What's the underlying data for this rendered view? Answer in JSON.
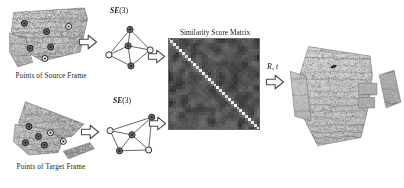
{
  "figure": {
    "type": "pipeline-diagram",
    "background": "#ffffff",
    "ink": "#1a1a1a"
  },
  "rows": {
    "source": {
      "caption": "Points of Source Frame",
      "graph_label_prefix": "SE",
      "graph_label_suffix": "(3)",
      "arrow1_name": "arrow-source-to-graph",
      "arrow2_name": "arrow-source-graph-to-matrix"
    },
    "target": {
      "caption": "Points of Target Frame",
      "graph_label_prefix": "SE",
      "graph_label_suffix": "(3)",
      "arrow1_name": "arrow-target-to-graph",
      "arrow2_name": "arrow-target-graph-to-matrix"
    }
  },
  "matrix": {
    "title": "Similarity Score Matrix",
    "colormap": "grayscale",
    "size_px": 92,
    "diagonal": "bright"
  },
  "result": {
    "transform_label": "R, t",
    "arrow_name": "arrow-matrix-to-result",
    "caption": ""
  },
  "chart_data": {
    "type": "heatmap",
    "title": "Similarity Score Matrix",
    "xlabel": "",
    "ylabel": "",
    "grid": false,
    "legend": "none",
    "rows": 32,
    "cols": 32,
    "value_range": [
      0,
      1
    ],
    "diagonal_values": [
      0.95,
      0.88,
      0.92,
      0.85,
      0.97,
      0.9,
      0.83,
      0.94,
      0.89,
      0.96,
      0.86,
      0.91,
      0.93,
      0.87,
      0.98,
      0.84,
      0.9,
      0.95,
      0.88,
      0.92,
      0.86,
      0.94,
      0.89,
      0.97,
      0.85,
      0.91,
      0.93,
      0.87,
      0.96,
      0.9,
      0.88,
      0.94
    ],
    "background_mean": 0.32,
    "background_std": 0.18
  },
  "graphs": {
    "source": {
      "nodes": [
        {
          "id": "n0",
          "x": 0.5,
          "y": 0.06,
          "fill": "dark"
        },
        {
          "id": "n1",
          "x": 0.46,
          "y": 0.46,
          "fill": "dark"
        },
        {
          "id": "n2",
          "x": 0.92,
          "y": 0.56,
          "fill": "light"
        },
        {
          "id": "n3",
          "x": 0.06,
          "y": 0.68,
          "fill": "light"
        },
        {
          "id": "n4",
          "x": 0.52,
          "y": 0.95,
          "fill": "dark"
        }
      ],
      "edges": [
        [
          0,
          1
        ],
        [
          0,
          2
        ],
        [
          0,
          3
        ],
        [
          1,
          2
        ],
        [
          1,
          3
        ],
        [
          1,
          4
        ],
        [
          2,
          4
        ],
        [
          3,
          4
        ]
      ]
    },
    "target": {
      "nodes": [
        {
          "id": "m0",
          "x": 0.88,
          "y": 0.1,
          "fill": "dark"
        },
        {
          "id": "m1",
          "x": 0.08,
          "y": 0.42,
          "fill": "light"
        },
        {
          "id": "m2",
          "x": 0.5,
          "y": 0.52,
          "fill": "dark"
        },
        {
          "id": "m3",
          "x": 0.26,
          "y": 0.9,
          "fill": "dark"
        },
        {
          "id": "m4",
          "x": 0.82,
          "y": 0.88,
          "fill": "light"
        }
      ],
      "edges": [
        [
          0,
          1
        ],
        [
          0,
          2
        ],
        [
          0,
          4
        ],
        [
          1,
          2
        ],
        [
          1,
          3
        ],
        [
          2,
          3
        ],
        [
          2,
          4
        ],
        [
          3,
          4
        ]
      ]
    }
  },
  "keypoints": {
    "source": [
      {
        "x": 0.2,
        "y": 0.27
      },
      {
        "x": 0.47,
        "y": 0.4
      },
      {
        "x": 0.74,
        "y": 0.32
      },
      {
        "x": 0.27,
        "y": 0.66
      },
      {
        "x": 0.52,
        "y": 0.64
      },
      {
        "x": 0.45,
        "y": 0.82
      }
    ],
    "target": [
      {
        "x": 0.22,
        "y": 0.46
      },
      {
        "x": 0.33,
        "y": 0.62
      },
      {
        "x": 0.47,
        "y": 0.56
      },
      {
        "x": 0.18,
        "y": 0.72
      },
      {
        "x": 0.4,
        "y": 0.76
      },
      {
        "x": 0.62,
        "y": 0.7
      }
    ]
  }
}
